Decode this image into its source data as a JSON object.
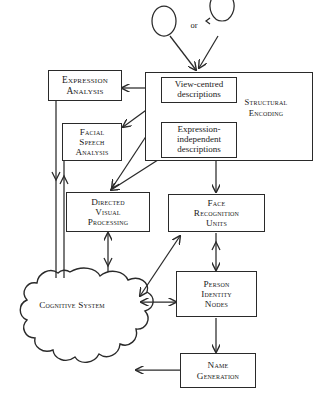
{
  "diagram": {
    "stimulus": {
      "or_label": "or",
      "face_front_name": "front-view-face",
      "face_profile_name": "profile-view-face"
    },
    "nodes": {
      "expression_analysis": {
        "lines": [
          "Expression",
          "Analysis"
        ],
        "line1": "Expression",
        "line2": "Analysis"
      },
      "facial_speech_analysis": {
        "line1": "Facial",
        "line2": "Speech",
        "line3": "Analysis"
      },
      "structural_encoding": {
        "line1": "Structural",
        "line2": "Encoding"
      },
      "view_centred_descriptions": {
        "line1": "View-centred",
        "line2": "descriptions"
      },
      "expression_independent_descriptions": {
        "line1": "Expression-",
        "line2": "independent",
        "line3": "descriptions"
      },
      "directed_visual_processing": {
        "line1": "Directed",
        "line2": "Visual",
        "line3": "Processing"
      },
      "face_recognition_units": {
        "line1": "Face",
        "line2": "Recognition",
        "line3": "Units"
      },
      "person_identity_nodes": {
        "line1": "Person",
        "line2": "Identity",
        "line3": "Nodes"
      },
      "name_generation": {
        "line1": "Name",
        "line2": "Generation"
      },
      "cognitive_system": {
        "line1": "Cognitive",
        "line2": "System"
      }
    },
    "colors": {
      "stroke": "#2a2a2a",
      "text": "#1a1a1a",
      "background": "#ffffff"
    }
  }
}
